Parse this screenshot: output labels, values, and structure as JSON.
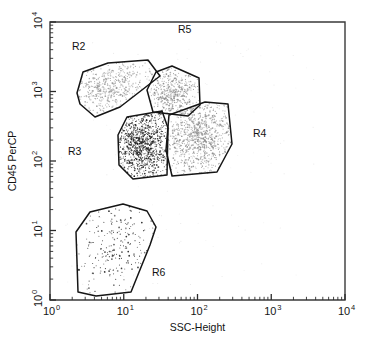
{
  "figure": {
    "kind": "flow-cytometry-dot-plot",
    "background_color": "#ffffff",
    "frame_color": "#3a3a3a",
    "gate_stroke_color": "#151515"
  },
  "axes": {
    "x": {
      "title": "SSC-Height",
      "scale": "log",
      "min": 1,
      "max": 10000,
      "tick_labels": [
        "10",
        "10",
        "10",
        "10",
        "10"
      ],
      "tick_exponents": [
        "0",
        "1",
        "2",
        "3",
        "4"
      ],
      "tick_values": [
        1,
        10,
        100,
        1000,
        10000
      ]
    },
    "y": {
      "title": "CD45 PerCP",
      "scale": "log",
      "min": 1,
      "max": 10000,
      "tick_labels": [
        "10",
        "10",
        "10",
        "10",
        "10"
      ],
      "tick_exponents": [
        "0",
        "1",
        "2",
        "3",
        "4"
      ],
      "tick_values": [
        1,
        10,
        100,
        1000,
        10000
      ]
    }
  },
  "regions": [
    {
      "name": "R2",
      "label": "R2",
      "label_x": 72,
      "label_y": 50,
      "dot_color": "#9a9a9a",
      "dot_count": 460,
      "polygon": [
        [
          77,
          93
        ],
        [
          83,
          72
        ],
        [
          108,
          63
        ],
        [
          148,
          60
        ],
        [
          160,
          76
        ],
        [
          120,
          107
        ],
        [
          95,
          117
        ],
        [
          80,
          104
        ]
      ],
      "centroid_x_value": 9,
      "centroid_y_value": 1050
    },
    {
      "name": "R5",
      "label": "R5",
      "label_x": 178,
      "label_y": 33,
      "dot_color": "#8f8f8f",
      "dot_count": 400,
      "polygon": [
        [
          172,
          66
        ],
        [
          199,
          78
        ],
        [
          200,
          105
        ],
        [
          188,
          116
        ],
        [
          153,
          112
        ],
        [
          147,
          90
        ],
        [
          156,
          72
        ]
      ],
      "centroid_x_value": 32,
      "centroid_y_value": 950
    },
    {
      "name": "R3",
      "label": "R3",
      "label_x": 68,
      "label_y": 155,
      "dot_color": "#222222",
      "dot_count": 900,
      "polygon": [
        [
          127,
          117
        ],
        [
          162,
          111
        ],
        [
          168,
          128
        ],
        [
          167,
          175
        ],
        [
          133,
          179
        ],
        [
          119,
          165
        ],
        [
          118,
          135
        ]
      ],
      "centroid_x_value": 19,
      "centroid_y_value": 220
    },
    {
      "name": "R4",
      "label": "R4",
      "label_x": 253,
      "label_y": 137,
      "dot_color": "#909090",
      "dot_count": 820,
      "polygon": [
        [
          169,
          115
        ],
        [
          205,
          102
        ],
        [
          228,
          104
        ],
        [
          232,
          144
        ],
        [
          217,
          172
        ],
        [
          172,
          176
        ],
        [
          166,
          150
        ]
      ],
      "centroid_x_value": 105,
      "centroid_y_value": 300
    },
    {
      "name": "R6",
      "label": "R6",
      "label_x": 152,
      "label_y": 276,
      "dot_color": "#2a2a2a",
      "dot_count": 230,
      "polygon": [
        [
          76,
          232
        ],
        [
          90,
          212
        ],
        [
          123,
          204
        ],
        [
          147,
          211
        ],
        [
          156,
          227
        ],
        [
          150,
          245
        ],
        [
          131,
          292
        ],
        [
          96,
          296
        ],
        [
          78,
          292
        ]
      ],
      "centroid_x_value": 7,
      "centroid_y_value": 5
    }
  ],
  "chart_data": {
    "type": "scatter",
    "title": "",
    "xlabel": "SSC-Height",
    "ylabel": "CD45 PerCP",
    "xscale": "log",
    "yscale": "log",
    "xlim": [
      1,
      10000
    ],
    "ylim": [
      1,
      10000
    ],
    "grid": false,
    "legend": "none",
    "annotations": [
      "R2",
      "R3",
      "R4",
      "R5",
      "R6"
    ],
    "series": [
      {
        "name": "R2",
        "description": "Gated lymphocyte-like gray population, low side scatter, bright CD45",
        "color": "#9a9a9a",
        "approx_n": 460,
        "x_center": 9,
        "y_center": 1050,
        "x_range": [
          4,
          25
        ],
        "y_range": [
          550,
          2200
        ]
      },
      {
        "name": "R5",
        "description": "Gated gray population, intermediate side scatter, bright CD45",
        "color": "#8f8f8f",
        "approx_n": 400,
        "x_center": 32,
        "y_center": 950,
        "x_range": [
          18,
          60
        ],
        "y_range": [
          450,
          2300
        ]
      },
      {
        "name": "R3",
        "description": "Dense dark blast population, low-intermediate side scatter, dim CD45",
        "color": "#222222",
        "approx_n": 900,
        "x_center": 19,
        "y_center": 220,
        "x_range": [
          11,
          36
        ],
        "y_range": [
          70,
          520
        ]
      },
      {
        "name": "R4",
        "description": "Gated gray granulocyte-like population, high side scatter, intermediate CD45",
        "color": "#909090",
        "approx_n": 820,
        "x_center": 105,
        "y_center": 300,
        "x_range": [
          35,
          290
        ],
        "y_range": [
          70,
          600
        ]
      },
      {
        "name": "R6",
        "description": "Sparse dark debris/RBC population, low side scatter, CD45 negative",
        "color": "#2a2a2a",
        "approx_n": 230,
        "x_center": 7,
        "y_center": 5,
        "x_range": [
          2.5,
          28
        ],
        "y_range": [
          1,
          19
        ]
      }
    ]
  }
}
